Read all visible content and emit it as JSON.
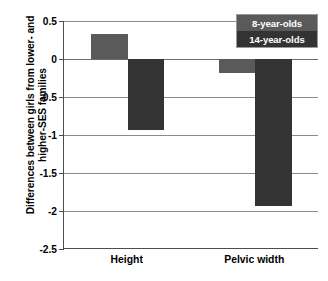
{
  "chart_data": {
    "type": "bar",
    "title": "",
    "xlabel": "",
    "ylabel": "Differences between girls from lower- and higher-SES families",
    "ylabel_lines": [
      "Differences between girls from lower- and",
      "higher-SES families"
    ],
    "categories": [
      "Height",
      "Pelvic width"
    ],
    "series": [
      {
        "name": "8-year-olds",
        "color": "#5a5a5a",
        "values": [
          0.33,
          -0.18
        ]
      },
      {
        "name": "14-year-olds",
        "color": "#333333",
        "values": [
          -0.94,
          -1.93
        ]
      }
    ],
    "ylim": [
      -2.5,
      0.5
    ],
    "ytick_labels": [
      "0.5",
      "0",
      "-0.5",
      "-1",
      "-1.5",
      "-2",
      "-2.5"
    ],
    "ytick_values": [
      0.5,
      0,
      -0.5,
      -1,
      -1.5,
      -2,
      -2.5
    ],
    "grid": true,
    "legend_position": "top-right",
    "legend_entries": [
      "8-year-olds",
      "14-year-olds"
    ]
  }
}
